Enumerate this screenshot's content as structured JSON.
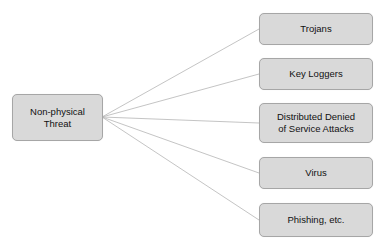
{
  "diagram": {
    "root": {
      "label_line1": "Non-physical",
      "label_line2": "Threat"
    },
    "children": [
      {
        "label": "Trojans"
      },
      {
        "label": "Key Loggers"
      },
      {
        "label_line1": "Distributed Denied",
        "label_line2": "of Service Attacks"
      },
      {
        "label": "Virus"
      },
      {
        "label": "Phishing, etc."
      }
    ],
    "colors": {
      "node_fill": "#d9d9d9",
      "node_border": "#a6a6a6",
      "connector": "#b0b0b0"
    }
  }
}
